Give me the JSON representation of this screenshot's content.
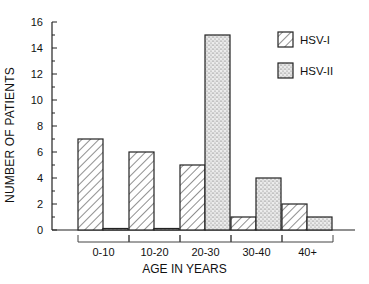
{
  "chart_data": {
    "type": "bar",
    "title": "",
    "xlabel": "AGE IN YEARS",
    "ylabel": "NUMBER OF PATIENTS",
    "categories": [
      "0-10",
      "10-20",
      "20-30",
      "30-40",
      "40+"
    ],
    "series": [
      {
        "name": "HSV-I",
        "pattern": "diagonal-hatch",
        "values": [
          7,
          6,
          5,
          1,
          2
        ]
      },
      {
        "name": "HSV-II",
        "pattern": "stipple",
        "values": [
          0,
          0,
          15,
          4,
          1
        ]
      }
    ],
    "ylim": [
      0,
      16
    ],
    "yticks": [
      0,
      2,
      4,
      6,
      8,
      10,
      12,
      14,
      16
    ],
    "grid": false,
    "legend_position": "upper-right"
  },
  "labels": {
    "xlabel": "AGE IN YEARS",
    "ylabel": "NUMBER OF PATIENTS",
    "legend": [
      "HSV-I",
      "HSV-II"
    ]
  }
}
